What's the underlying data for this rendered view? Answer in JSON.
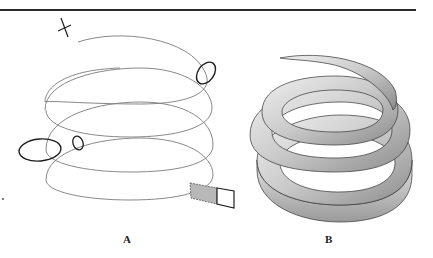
{
  "figure": {
    "panels": [
      {
        "id": "A",
        "label": "A",
        "description": "Helical path with profile cross-sections"
      },
      {
        "id": "B",
        "label": "B",
        "description": "Swept solid along helix"
      }
    ]
  },
  "colors": {
    "rule": "#2a2a2a",
    "helix_line": "#7a7a7a",
    "profile_line": "#1e1e1e",
    "shade": "#b8b8b8",
    "solid_light": "#d8d8d8",
    "solid_dark": "#8a8a8a"
  }
}
